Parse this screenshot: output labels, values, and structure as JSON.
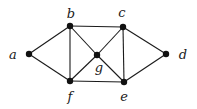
{
  "diagram": {
    "type": "undirected-graph",
    "nodes": [
      {
        "id": "a",
        "label": "a",
        "x": 29,
        "y": 54,
        "lx": 13,
        "ly": 59
      },
      {
        "id": "b",
        "label": "b",
        "x": 70,
        "y": 26,
        "lx": 71,
        "ly": 18
      },
      {
        "id": "c",
        "label": "c",
        "x": 123,
        "y": 27,
        "lx": 122,
        "ly": 17
      },
      {
        "id": "d",
        "label": "d",
        "x": 166,
        "y": 54,
        "lx": 183,
        "ly": 59
      },
      {
        "id": "e",
        "label": "e",
        "x": 124,
        "y": 82,
        "lx": 124,
        "ly": 101
      },
      {
        "id": "f",
        "label": "f",
        "x": 70,
        "y": 81,
        "lx": 70,
        "ly": 101
      },
      {
        "id": "g",
        "label": "g",
        "x": 97,
        "y": 55,
        "lx": 99,
        "ly": 72
      }
    ],
    "edges": [
      [
        "a",
        "b"
      ],
      [
        "a",
        "f"
      ],
      [
        "b",
        "c"
      ],
      [
        "b",
        "f"
      ],
      [
        "b",
        "g"
      ],
      [
        "c",
        "g"
      ],
      [
        "c",
        "e"
      ],
      [
        "c",
        "d"
      ],
      [
        "f",
        "g"
      ],
      [
        "g",
        "e"
      ],
      [
        "f",
        "e"
      ],
      [
        "e",
        "d"
      ]
    ],
    "colors": {
      "edge": "#1a1a1a",
      "node": "#111111",
      "label": "#1a1a1a",
      "background": "#ffffff"
    }
  }
}
